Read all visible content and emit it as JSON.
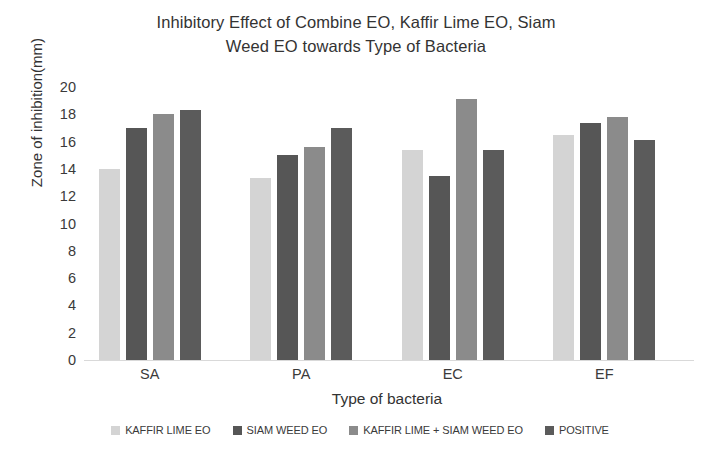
{
  "chart_data": {
    "type": "bar",
    "title": "Inhibitory Effect of Combine EO, Kaffir Lime EO, Siam Weed EO towards Type of Bacteria",
    "title_lines": [
      "Inhibitory Effect of Combine EO, Kaffir Lime EO, Siam",
      "Weed EO towards Type of Bacteria"
    ],
    "xlabel": "Type of bacteria",
    "ylabel": "Zone of inhibition(mm)",
    "categories": [
      "SA",
      "PA",
      "EC",
      "EF"
    ],
    "ylim": [
      0,
      20
    ],
    "ytick_step": 2,
    "ytick_labels": [
      "20",
      "18",
      "16",
      "14",
      "12",
      "10",
      "8",
      "6",
      "4",
      "2",
      "0"
    ],
    "grid": false,
    "legend_position": "bottom",
    "series": [
      {
        "name": "KAFFIR LIME EO",
        "color": "#d4d4d4",
        "values": [
          14.0,
          13.3,
          15.4,
          16.5
        ]
      },
      {
        "name": "SIAM WEED EO",
        "color": "#565656",
        "values": [
          17.0,
          15.0,
          13.5,
          17.4
        ]
      },
      {
        "name": "KAFFIR LIME + SIAM WEED EO",
        "color": "#8b8b8b",
        "values": [
          18.0,
          15.6,
          19.1,
          17.8
        ]
      },
      {
        "name": "POSITIVE",
        "color": "#5b5b5b",
        "values": [
          18.3,
          17.0,
          15.4,
          16.1
        ]
      }
    ]
  },
  "colors": {
    "series_1": "#d4d4d4",
    "series_2": "#565656",
    "series_3": "#8b8b8b",
    "series_4": "#5b5b5b",
    "axis_line": "#d9d9d9",
    "text": "#333333",
    "background": "#ffffff"
  }
}
